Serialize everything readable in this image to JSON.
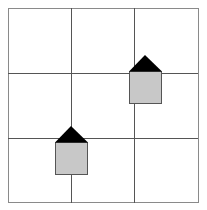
{
  "diagram": {
    "type": "grid-with-houses",
    "grid": {
      "rows": 3,
      "cols": 3,
      "line_color": "#555555",
      "frame_color": "#888888"
    },
    "houses": [
      {
        "name": "house-top-right",
        "roof_color": "#000000",
        "body_color": "#c8c8c8"
      },
      {
        "name": "house-bottom-left",
        "roof_color": "#000000",
        "body_color": "#c8c8c8"
      }
    ]
  }
}
